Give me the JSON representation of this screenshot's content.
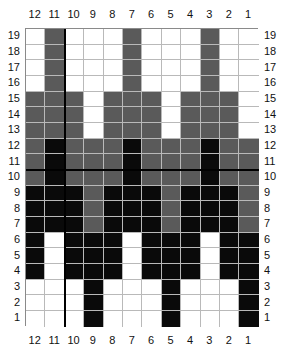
{
  "chart_data": {
    "type": "heatmap",
    "title": "",
    "xlabel": "",
    "ylabel": "",
    "column_labels": [
      "12",
      "11",
      "10",
      "9",
      "8",
      "7",
      "6",
      "5",
      "4",
      "3",
      "2",
      "1"
    ],
    "row_labels": [
      "19",
      "18",
      "17",
      "16",
      "15",
      "14",
      "13",
      "12",
      "11",
      "10",
      "9",
      "8",
      "7",
      "6",
      "5",
      "4",
      "3",
      "2",
      "1"
    ],
    "legend": [
      {
        "key": "W",
        "label": "white",
        "color": "#ffffff"
      },
      {
        "key": "G",
        "label": "gray",
        "color": "#5a5a5a"
      },
      {
        "key": "B",
        "label": "black",
        "color": "#0a0a0a"
      }
    ],
    "grid_line_color": "#b9b9b9",
    "border_color": "#8a8a8a",
    "heavy_line_color": "#000000",
    "heavy_vertical_after_column": "11",
    "heavy_horizontal_below_row": "11",
    "cells": [
      {
        "row": "19",
        "values": [
          "W",
          "G",
          "W",
          "W",
          "W",
          "G",
          "W",
          "W",
          "W",
          "G",
          "W",
          "W"
        ]
      },
      {
        "row": "18",
        "values": [
          "W",
          "G",
          "W",
          "W",
          "W",
          "G",
          "W",
          "W",
          "W",
          "G",
          "W",
          "W"
        ]
      },
      {
        "row": "17",
        "values": [
          "W",
          "G",
          "W",
          "W",
          "W",
          "G",
          "W",
          "W",
          "W",
          "G",
          "W",
          "W"
        ]
      },
      {
        "row": "16",
        "values": [
          "W",
          "G",
          "W",
          "W",
          "W",
          "G",
          "W",
          "W",
          "W",
          "G",
          "W",
          "W"
        ]
      },
      {
        "row": "15",
        "values": [
          "G",
          "G",
          "G",
          "W",
          "G",
          "G",
          "G",
          "W",
          "G",
          "G",
          "G",
          "W"
        ]
      },
      {
        "row": "14",
        "values": [
          "G",
          "G",
          "G",
          "W",
          "G",
          "G",
          "G",
          "W",
          "G",
          "G",
          "G",
          "W"
        ]
      },
      {
        "row": "13",
        "values": [
          "G",
          "G",
          "G",
          "W",
          "G",
          "G",
          "G",
          "W",
          "G",
          "G",
          "G",
          "W"
        ]
      },
      {
        "row": "12",
        "values": [
          "G",
          "B",
          "G",
          "G",
          "G",
          "B",
          "G",
          "G",
          "G",
          "B",
          "G",
          "G"
        ]
      },
      {
        "row": "11",
        "values": [
          "G",
          "B",
          "G",
          "G",
          "G",
          "B",
          "G",
          "G",
          "G",
          "B",
          "G",
          "G"
        ]
      },
      {
        "row": "10",
        "values": [
          "G",
          "B",
          "G",
          "G",
          "G",
          "B",
          "G",
          "G",
          "G",
          "B",
          "G",
          "G"
        ]
      },
      {
        "row": "9",
        "values": [
          "B",
          "B",
          "B",
          "G",
          "B",
          "B",
          "B",
          "G",
          "B",
          "B",
          "B",
          "G"
        ]
      },
      {
        "row": "8",
        "values": [
          "B",
          "B",
          "B",
          "G",
          "B",
          "B",
          "B",
          "G",
          "B",
          "B",
          "B",
          "G"
        ]
      },
      {
        "row": "7",
        "values": [
          "B",
          "B",
          "B",
          "G",
          "B",
          "B",
          "B",
          "G",
          "B",
          "B",
          "B",
          "G"
        ]
      },
      {
        "row": "6",
        "values": [
          "B",
          "W",
          "B",
          "B",
          "B",
          "W",
          "B",
          "B",
          "B",
          "W",
          "B",
          "B"
        ]
      },
      {
        "row": "5",
        "values": [
          "B",
          "W",
          "B",
          "B",
          "B",
          "W",
          "B",
          "B",
          "B",
          "W",
          "B",
          "B"
        ]
      },
      {
        "row": "4",
        "values": [
          "B",
          "W",
          "B",
          "B",
          "B",
          "W",
          "B",
          "B",
          "B",
          "W",
          "B",
          "B"
        ]
      },
      {
        "row": "3",
        "values": [
          "W",
          "W",
          "W",
          "B",
          "W",
          "W",
          "W",
          "B",
          "W",
          "W",
          "W",
          "B"
        ]
      },
      {
        "row": "2",
        "values": [
          "W",
          "W",
          "W",
          "B",
          "W",
          "W",
          "W",
          "B",
          "W",
          "W",
          "W",
          "B"
        ]
      },
      {
        "row": "1",
        "values": [
          "W",
          "W",
          "W",
          "B",
          "W",
          "W",
          "W",
          "B",
          "W",
          "W",
          "W",
          "B"
        ]
      }
    ]
  }
}
